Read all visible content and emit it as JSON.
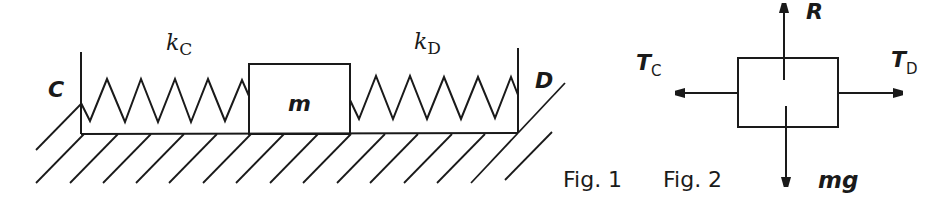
{
  "figure1": {
    "caption": "Fig. 1",
    "wall_left_label": "C",
    "wall_right_label": "D",
    "mass_label": "m",
    "spring_left": {
      "symbol": "k",
      "subscript": "C"
    },
    "spring_right": {
      "symbol": "k",
      "subscript": "D"
    }
  },
  "figure2": {
    "caption": "Fig. 2",
    "forces": {
      "up": {
        "symbol": "R",
        "subscript": ""
      },
      "left": {
        "symbol": "T",
        "subscript": "C"
      },
      "right": {
        "symbol": "T",
        "subscript": "D"
      },
      "down": {
        "symbol": "mg",
        "subscript": ""
      }
    }
  },
  "colors": {
    "ink": "#1a1a1a",
    "background": "#ffffff"
  }
}
